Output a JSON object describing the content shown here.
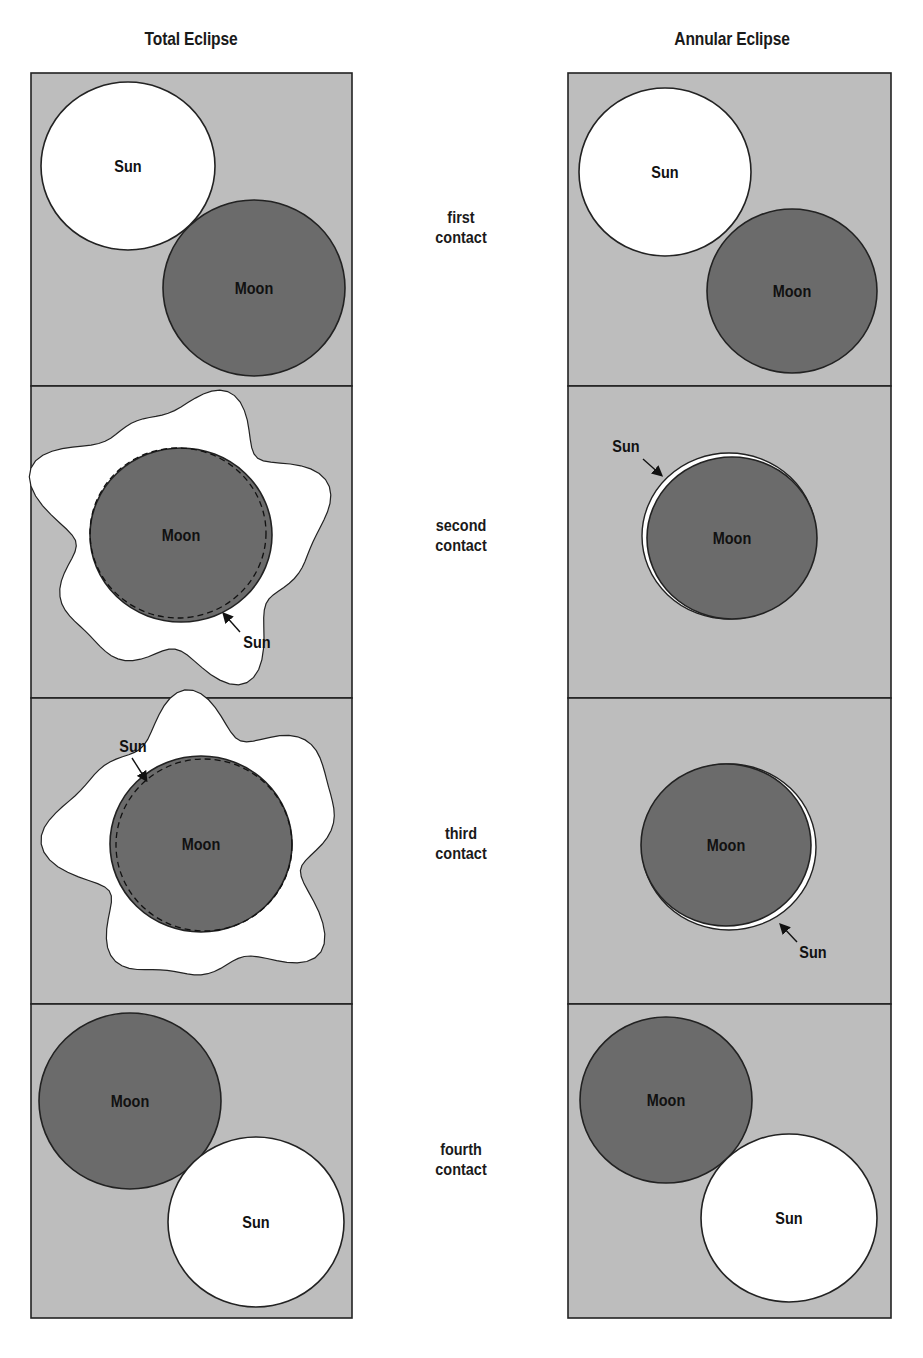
{
  "titles": {
    "left": "Total Eclipse",
    "right": "Annular Eclipse"
  },
  "contacts": [
    {
      "line1": "first",
      "line2": "contact"
    },
    {
      "line1": "second",
      "line2": "contact"
    },
    {
      "line1": "third",
      "line2": "contact"
    },
    {
      "line1": "fourth",
      "line2": "contact"
    }
  ],
  "colors": {
    "panel_bg": "#bdbdbd",
    "moon": "#6b6b6b",
    "sun": "#ffffff",
    "outline": "#222222"
  },
  "labels": {
    "sun": "Sun",
    "moon": "Moon"
  },
  "layout": {
    "left_panel": {
      "x": 31,
      "w": 321
    },
    "right_panel": {
      "x": 568,
      "w": 323
    },
    "rows": [
      73,
      386,
      698,
      1004,
      1318
    ]
  },
  "panels": {
    "total": [
      {
        "sun": {
          "cx": 128,
          "cy": 166,
          "rx": 87,
          "ry": 84
        },
        "moon": {
          "cx": 254,
          "cy": 288,
          "rx": 91,
          "ry": 88
        }
      },
      {
        "corona": true,
        "moon": {
          "cx": 181,
          "cy": 535,
          "rx": 91,
          "ry": 87
        },
        "sun_label": {
          "x": 257,
          "y": 648
        },
        "arrow": {
          "x1": 240,
          "y1": 632,
          "x2": 224,
          "y2": 614
        }
      },
      {
        "corona": true,
        "moon": {
          "cx": 201,
          "cy": 844,
          "rx": 91,
          "ry": 88
        },
        "sun_label": {
          "x": 133,
          "y": 752
        },
        "arrow": {
          "x1": 132,
          "y1": 758,
          "x2": 146,
          "y2": 780
        }
      },
      {
        "moon": {
          "cx": 130,
          "cy": 1101,
          "rx": 91,
          "ry": 88
        },
        "sun": {
          "cx": 256,
          "cy": 1222,
          "rx": 88,
          "ry": 85
        }
      }
    ],
    "annular": [
      {
        "sun": {
          "cx": 665,
          "cy": 172,
          "rx": 86,
          "ry": 84
        },
        "moon": {
          "cx": 792,
          "cy": 291,
          "rx": 85,
          "ry": 82
        }
      },
      {
        "ring": {
          "cx": 729,
          "cy": 536,
          "rx": 87,
          "ry": 83
        },
        "moon": {
          "cx": 732,
          "cy": 538,
          "rx": 85,
          "ry": 81
        },
        "sun_label": {
          "x": 626,
          "y": 452
        },
        "arrow": {
          "x1": 643,
          "y1": 459,
          "x2": 661,
          "y2": 475
        }
      },
      {
        "ring": {
          "cx": 729,
          "cy": 847,
          "rx": 87,
          "ry": 83
        },
        "moon": {
          "cx": 726,
          "cy": 845,
          "rx": 85,
          "ry": 81
        },
        "sun_label": {
          "x": 813,
          "y": 958
        },
        "arrow": {
          "x1": 797,
          "y1": 942,
          "x2": 781,
          "y2": 925
        }
      },
      {
        "moon": {
          "cx": 666,
          "cy": 1100,
          "rx": 86,
          "ry": 83
        },
        "sun": {
          "cx": 789,
          "cy": 1218,
          "rx": 88,
          "ry": 84
        }
      }
    ]
  }
}
